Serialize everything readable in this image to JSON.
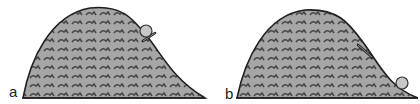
{
  "panels": [
    {
      "id": "a",
      "label": "a",
      "description": "Ball and stick near the top of the hill, on the right slope",
      "ball": {
        "cx": 147,
        "cy": 32,
        "r": 6
      },
      "stick": {
        "x1": 143,
        "y1": 41,
        "x2": 155,
        "y2": 34
      }
    },
    {
      "id": "b",
      "label": "b",
      "description": "Ball rolled down to the bottom of the hill; stick left on the slope",
      "ball": {
        "cx": 192,
        "cy": 83,
        "r": 6
      },
      "stick": {
        "x1": 148,
        "y1": 44,
        "x2": 163,
        "y2": 58
      }
    }
  ],
  "colors": {
    "hill_fill": "#a6a6a6",
    "hill_outline": "#1e1e1e",
    "texture": "#2e2e2e",
    "ball_fill": "#c8c8c8",
    "ball_outline": "#333333",
    "ground": "#222222"
  }
}
